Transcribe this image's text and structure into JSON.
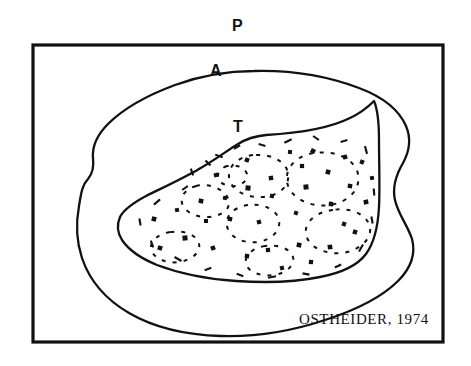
{
  "figure": {
    "domain_kind": "scientific-line-diagram",
    "background_color": "#ffffff",
    "ink_color": "#111111",
    "width": 471,
    "height": 366,
    "attribution": "OSTHEIDER,  1974",
    "labels": {
      "p": "P",
      "a": "A",
      "t": "T"
    },
    "frame": {
      "name": "outer-rectangular-frame",
      "x": 33,
      "y": 45,
      "width": 410,
      "height": 297,
      "stroke_width": 3.2
    },
    "regions": [
      {
        "key": "p",
        "label": "P",
        "name": "region-p-frame",
        "description": "outer rectangular frame region labelled P",
        "style": "solid"
      },
      {
        "key": "a",
        "label": "A",
        "name": "region-a-outer-blob",
        "description": "outer irregular closed curve labelled A",
        "style": "solid"
      },
      {
        "key": "t",
        "label": "T",
        "name": "region-t-inner-blob",
        "description": "inner irregular closed curve labelled T containing dashed cells and stipple dots",
        "style": "solid"
      }
    ],
    "outer_blob_path": "M 254 71 C 292 70 330 77 359 88 C 383 97 399 110 406 126 C 412 140 409 152 403 163 C 396 175 392 187 395 200 C 398 214 408 226 412 239 C 416 254 411 268 398 281 C 382 297 356 310 325 320 C 292 331 255 337 221 336 C 186 335 153 327 129 313 C 105 299 89 279 82 258 C 76 240 76 222 79 206 C 81 194 82 185 88 179 C 93 173 94 166 93 158 C 92 146 97 135 108 124 C 124 108 148 95 175 85 C 200 76 228 71 254 71 Z",
    "inner_blob_path": "M 266 135 C 300 133 330 128 350 118 C 363 112 370 105 374 101 C 377 108 379 122 379 140 C 379 163 380 186 379 207 C 378 226 374 243 366 254 C 357 266 341 273 320 277 C 296 282 266 283 236 281 C 206 279 178 273 157 265 C 140 258 128 249 122 240 C 117 232 117 224 120 217 C 124 209 133 203 146 196 C 162 188 182 179 199 169 C 215 160 228 150 238 144 C 246 139 256 136 266 135 Z",
    "cell_paths": [
      "M 196 186 C 186 189 180 196 182 203 C 184 211 194 217 206 217 C 219 217 229 211 229 203 C 229 194 218 186 205 185 C 202 185 199 185 196 186 Z",
      "M 253 155 C 238 157 228 166 229 177 C 230 189 245 198 262 197 C 279 196 290 186 288 174 C 287 162 272 154 256 155 C 255 155 254 155 253 155 Z",
      "M 248 205 C 234 207 225 216 227 226 C 229 237 243 244 258 242 C 272 240 281 230 279 220 C 277 210 263 203 249 205 Z",
      "M 313 153 C 296 156 285 168 287 182 C 290 198 310 208 330 205 C 349 202 361 189 358 174 C 355 159 335 150 316 153 Z",
      "M 333 210 C 316 212 304 222 306 234 C 308 247 325 255 343 253 C 360 250 372 239 370 227 C 367 214 350 207 333 210 Z",
      "M 170 232 C 158 234 150 241 151 249 C 153 258 166 264 179 262 C 192 260 201 252 199 244 C 197 235 184 230 171 232 Z",
      "M 265 246 C 252 248 244 256 246 264 C 248 272 261 277 274 275 C 287 273 295 265 293 257 C 291 249 278 244 265 246 Z",
      "M 227 166 C 221 168 217 173 218 178 C 220 184 228 187 236 186 C 244 184 248 179 247 174 C 245 168 237 164 229 166 Z"
    ],
    "stipple_dots": [
      {
        "x": 201,
        "y": 201,
        "w": 4.6,
        "h": 4.6,
        "r": 10
      },
      {
        "x": 216,
        "y": 175,
        "w": 4.2,
        "h": 4.2,
        "r": -12
      },
      {
        "x": 247,
        "y": 160,
        "w": 4.4,
        "h": 4.4,
        "r": 20
      },
      {
        "x": 248,
        "y": 188,
        "w": 5.0,
        "h": 5.0,
        "r": 5
      },
      {
        "x": 271,
        "y": 178,
        "w": 4.4,
        "h": 4.4,
        "r": -8
      },
      {
        "x": 272,
        "y": 196,
        "w": 4.2,
        "h": 4.2,
        "r": 15
      },
      {
        "x": 302,
        "y": 166,
        "w": 4.2,
        "h": 4.2,
        "r": 0
      },
      {
        "x": 313,
        "y": 151,
        "w": 4.6,
        "h": 4.6,
        "r": 25
      },
      {
        "x": 306,
        "y": 187,
        "w": 5.0,
        "h": 5.0,
        "r": -5
      },
      {
        "x": 328,
        "y": 172,
        "w": 4.6,
        "h": 4.6,
        "r": 12
      },
      {
        "x": 345,
        "y": 157,
        "w": 4.4,
        "h": 4.4,
        "r": -18
      },
      {
        "x": 350,
        "y": 186,
        "w": 4.4,
        "h": 4.4,
        "r": 8
      },
      {
        "x": 362,
        "y": 162,
        "w": 4.2,
        "h": 4.2,
        "r": 22
      },
      {
        "x": 366,
        "y": 202,
        "w": 4.6,
        "h": 4.6,
        "r": -10
      },
      {
        "x": 331,
        "y": 204,
        "w": 4.4,
        "h": 4.4,
        "r": 6
      },
      {
        "x": 296,
        "y": 213,
        "w": 4.0,
        "h": 4.0,
        "r": 18
      },
      {
        "x": 259,
        "y": 222,
        "w": 4.2,
        "h": 4.2,
        "r": -14
      },
      {
        "x": 230,
        "y": 219,
        "w": 4.4,
        "h": 4.4,
        "r": 10
      },
      {
        "x": 206,
        "y": 221,
        "w": 4.0,
        "h": 4.0,
        "r": 0
      },
      {
        "x": 154,
        "y": 219,
        "w": 4.6,
        "h": 4.6,
        "r": 14
      },
      {
        "x": 185,
        "y": 238,
        "w": 5.0,
        "h": 5.0,
        "r": -6
      },
      {
        "x": 160,
        "y": 248,
        "w": 4.6,
        "h": 4.6,
        "r": 16
      },
      {
        "x": 213,
        "y": 248,
        "w": 4.4,
        "h": 4.4,
        "r": -20
      },
      {
        "x": 247,
        "y": 256,
        "w": 4.4,
        "h": 4.4,
        "r": 8
      },
      {
        "x": 268,
        "y": 250,
        "w": 4.2,
        "h": 4.2,
        "r": -4
      },
      {
        "x": 299,
        "y": 245,
        "w": 4.6,
        "h": 4.6,
        "r": 12
      },
      {
        "x": 330,
        "y": 247,
        "w": 4.6,
        "h": 4.6,
        "r": -8
      },
      {
        "x": 355,
        "y": 232,
        "w": 4.4,
        "h": 4.4,
        "r": 18
      },
      {
        "x": 311,
        "y": 262,
        "w": 4.2,
        "h": 4.2,
        "r": 5
      },
      {
        "x": 282,
        "y": 268,
        "w": 4.0,
        "h": 4.0,
        "r": -15
      },
      {
        "x": 344,
        "y": 224,
        "w": 4.2,
        "h": 4.2,
        "r": 22
      },
      {
        "x": 372,
        "y": 178,
        "w": 4.0,
        "h": 4.0,
        "r": -10
      },
      {
        "x": 225,
        "y": 198,
        "w": 4.0,
        "h": 4.0,
        "r": 10
      },
      {
        "x": 177,
        "y": 210,
        "w": 4.0,
        "h": 4.0,
        "r": -12
      },
      {
        "x": 290,
        "y": 152,
        "w": 4.0,
        "h": 4.0,
        "r": 6
      }
    ],
    "tick_marks": [
      {
        "x": 192,
        "y": 172,
        "len": 7,
        "r": 70
      },
      {
        "x": 219,
        "y": 156,
        "len": 8,
        "r": 20
      },
      {
        "x": 237,
        "y": 147,
        "len": 7,
        "r": -30
      },
      {
        "x": 262,
        "y": 145,
        "len": 7,
        "r": 15
      },
      {
        "x": 288,
        "y": 141,
        "len": 8,
        "r": -25
      },
      {
        "x": 316,
        "y": 138,
        "len": 7,
        "r": 35
      },
      {
        "x": 344,
        "y": 141,
        "len": 7,
        "r": -15
      },
      {
        "x": 366,
        "y": 150,
        "len": 8,
        "r": 75
      },
      {
        "x": 374,
        "y": 192,
        "len": 7,
        "r": 85
      },
      {
        "x": 372,
        "y": 220,
        "len": 7,
        "r": 80
      },
      {
        "x": 361,
        "y": 248,
        "len": 8,
        "r": -60
      },
      {
        "x": 338,
        "y": 266,
        "len": 7,
        "r": -25
      },
      {
        "x": 306,
        "y": 274,
        "len": 7,
        "r": 10
      },
      {
        "x": 272,
        "y": 277,
        "len": 8,
        "r": -10
      },
      {
        "x": 240,
        "y": 275,
        "len": 7,
        "r": 20
      },
      {
        "x": 208,
        "y": 269,
        "len": 7,
        "r": -20
      },
      {
        "x": 178,
        "y": 259,
        "len": 8,
        "r": 30
      },
      {
        "x": 152,
        "y": 244,
        "len": 7,
        "r": 70
      },
      {
        "x": 140,
        "y": 222,
        "len": 7,
        "r": 80
      },
      {
        "x": 157,
        "y": 202,
        "len": 8,
        "r": -40
      },
      {
        "x": 185,
        "y": 188,
        "len": 7,
        "r": -35
      },
      {
        "x": 208,
        "y": 163,
        "len": 7,
        "r": 45
      }
    ]
  }
}
